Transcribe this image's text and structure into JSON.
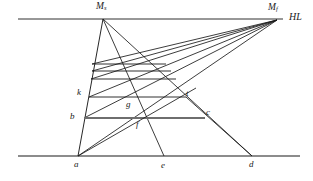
{
  "figure": {
    "type": "geometric-line-diagram",
    "colors": {
      "line": "#1a1a1a",
      "highlight": "#6e6e6e",
      "background": "#ffffff"
    },
    "labels": {
      "horizon_line": "HL",
      "measuring_point_side": "M",
      "measuring_point_side_sub": "s",
      "measuring_point_front": "M",
      "measuring_point_front_sub": "f",
      "a": "a",
      "b": "b",
      "c": "c",
      "d": "d",
      "e": "e",
      "f": "f",
      "g": "g",
      "k": "k",
      "t": "t"
    },
    "points": {
      "Ms": [
        103,
        19
      ],
      "Mf": [
        277,
        20
      ],
      "a": [
        78,
        156
      ],
      "e": [
        164,
        156
      ],
      "d": [
        252,
        156
      ],
      "b": [
        84,
        118
      ],
      "k": [
        89,
        97
      ],
      "c": [
        205,
        118
      ],
      "t": [
        186,
        99
      ],
      "g": [
        131,
        104
      ],
      "f": [
        141,
        120
      ]
    },
    "geometry": {
      "horizon_line": {
        "x1": 18,
        "y1": 19,
        "x2": 283,
        "y2": 19
      },
      "ground_line": {
        "x1": 18,
        "y1": 156,
        "x2": 300,
        "y2": 156
      },
      "left_edge": {
        "x1": 103,
        "y1": 19,
        "x2": 78,
        "y2": 156
      },
      "ms_rays": [
        {
          "x1": 103,
          "y1": 19,
          "x2": 164,
          "y2": 156
        },
        {
          "x1": 103,
          "y1": 19,
          "x2": 252,
          "y2": 156
        }
      ],
      "mf_rays": [
        {
          "x1": 277,
          "y1": 20,
          "x2": 92,
          "y2": 86
        },
        {
          "x1": 277,
          "y1": 20,
          "x2": 91,
          "y2": 90
        },
        {
          "x1": 277,
          "y1": 20,
          "x2": 89,
          "y2": 97
        },
        {
          "x1": 277,
          "y1": 20,
          "x2": 86,
          "y2": 108
        },
        {
          "x1": 277,
          "y1": 20,
          "x2": 84,
          "y2": 118
        },
        {
          "x1": 277,
          "y1": 20,
          "x2": 78,
          "y2": 156
        }
      ],
      "rungs": [
        {
          "x1": 92,
          "y1": 64,
          "x2": 166,
          "y2": 64
        },
        {
          "x1": 92,
          "y1": 71,
          "x2": 171,
          "y2": 71
        },
        {
          "x1": 91,
          "y1": 79,
          "x2": 176,
          "y2": 79
        },
        {
          "x1": 89,
          "y1": 97,
          "x2": 186,
          "y2": 97
        }
      ],
      "highlight_rung": {
        "x1": 84,
        "y1": 118,
        "x2": 205,
        "y2": 118
      },
      "diagonal_a_t": {
        "x1": 78,
        "y1": 156,
        "x2": 193,
        "y2": 90
      },
      "diagonal_c_d": {
        "x1": 205,
        "y1": 118,
        "x2": 252,
        "y2": 156
      }
    },
    "counts": {
      "mf_ray_count": 6,
      "ms_ray_count": 2,
      "rung_count": 5,
      "ground_points": 3
    }
  }
}
